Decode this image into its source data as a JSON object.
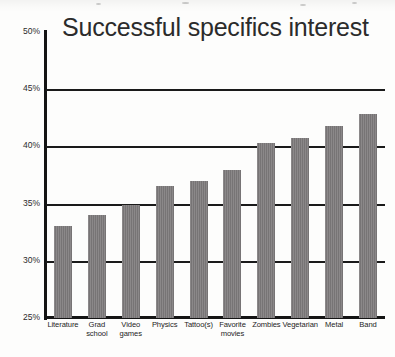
{
  "chart_data": {
    "type": "bar",
    "title": "Successful specifics interest",
    "xlabel": "",
    "ylabel": "",
    "ylim": [
      25,
      50
    ],
    "ytick_labels": [
      "50%",
      "45%",
      "40%",
      "35%",
      "30%",
      "25%"
    ],
    "ytick_values": [
      50,
      45,
      40,
      35,
      30,
      25
    ],
    "grid": true,
    "gridlines_at": [
      45,
      40,
      35,
      30
    ],
    "legend": "none",
    "value_suffix": "%",
    "categories": [
      "Literature",
      "Grad school",
      "Video games",
      "Physics",
      "Tattoo(s)",
      "Favorite movies",
      "Zombies",
      "Vegetarian",
      "Metal",
      "Band"
    ],
    "category_lines": [
      [
        "Literature"
      ],
      [
        "Grad",
        "school"
      ],
      [
        "Video",
        "games"
      ],
      [
        "Physics"
      ],
      [
        "Tattoo(s)"
      ],
      [
        "Favorite",
        "movies"
      ],
      [
        "Zombies"
      ],
      [
        "Vegetarian"
      ],
      [
        "Metal"
      ],
      [
        "Band"
      ]
    ],
    "values": [
      33.0,
      34.0,
      34.9,
      36.5,
      37.0,
      37.9,
      40.3,
      40.7,
      41.8,
      42.8
    ],
    "bar_color": "#7e7b7c",
    "axis_color": "#141414",
    "text_color": "#2b2b2b",
    "background": "#fdfdfc"
  }
}
